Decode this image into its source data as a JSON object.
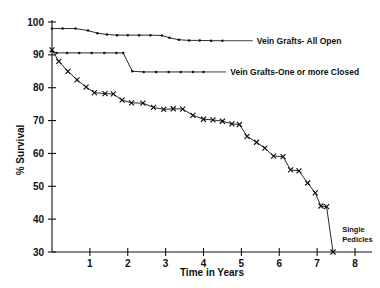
{
  "chart_data": {
    "type": "line",
    "title": "",
    "xlabel": "Time in Years",
    "ylabel": "% Survival",
    "xlim": [
      0,
      8
    ],
    "ylim": [
      30,
      100
    ],
    "grid": false,
    "legend_position": "inline-right",
    "x_ticks": [
      "1",
      "2",
      "3",
      "4",
      "5",
      "6",
      "7",
      "8"
    ],
    "x_tick_values": [
      1,
      2,
      3,
      4,
      5,
      6,
      7,
      8
    ],
    "y_ticks": [
      "30",
      "40",
      "50",
      "60",
      "70",
      "80",
      "90",
      "100"
    ],
    "y_tick_values": [
      30,
      40,
      50,
      60,
      70,
      80,
      90,
      100
    ],
    "annotations": [
      {
        "text": "Single Pedicles",
        "x": 7.45,
        "y": 30
      }
    ],
    "series": [
      {
        "name": "Vein Grafts - All Open",
        "label": "Vein Grafts- All Open",
        "marker": "dot",
        "points": [
          {
            "x": 0.0,
            "y": 98.0
          },
          {
            "x": 0.28,
            "y": 98.0
          },
          {
            "x": 0.62,
            "y": 98.0
          },
          {
            "x": 0.95,
            "y": 97.4
          },
          {
            "x": 1.2,
            "y": 96.6
          },
          {
            "x": 1.45,
            "y": 96.2
          },
          {
            "x": 1.72,
            "y": 96.0
          },
          {
            "x": 2.0,
            "y": 96.0
          },
          {
            "x": 2.3,
            "y": 96.0
          },
          {
            "x": 2.6,
            "y": 96.0
          },
          {
            "x": 2.9,
            "y": 95.9
          },
          {
            "x": 3.1,
            "y": 95.2
          },
          {
            "x": 3.35,
            "y": 94.6
          },
          {
            "x": 3.62,
            "y": 94.4
          },
          {
            "x": 3.9,
            "y": 94.4
          },
          {
            "x": 4.2,
            "y": 94.3
          },
          {
            "x": 4.5,
            "y": 94.3
          }
        ]
      },
      {
        "name": "Vein Grafts - One or more Closed",
        "label": "Vein Grafts-One or more Closed",
        "marker": "dot",
        "points": [
          {
            "x": 0.0,
            "y": 91.2
          },
          {
            "x": 0.12,
            "y": 90.6
          },
          {
            "x": 0.4,
            "y": 90.6
          },
          {
            "x": 0.72,
            "y": 90.6
          },
          {
            "x": 1.05,
            "y": 90.6
          },
          {
            "x": 1.38,
            "y": 90.6
          },
          {
            "x": 1.7,
            "y": 90.6
          },
          {
            "x": 1.88,
            "y": 90.6
          },
          {
            "x": 2.12,
            "y": 85.0
          },
          {
            "x": 2.42,
            "y": 84.8
          },
          {
            "x": 2.75,
            "y": 84.8
          },
          {
            "x": 3.08,
            "y": 84.8
          },
          {
            "x": 3.4,
            "y": 84.8
          },
          {
            "x": 3.72,
            "y": 84.8
          },
          {
            "x": 4.0,
            "y": 84.8
          }
        ]
      },
      {
        "name": "Single Pedicles",
        "label": "Single Pedicles",
        "marker": "x",
        "points": [
          {
            "x": 0.0,
            "y": 91.5
          },
          {
            "x": 0.18,
            "y": 88.0
          },
          {
            "x": 0.42,
            "y": 85.0
          },
          {
            "x": 0.66,
            "y": 82.4
          },
          {
            "x": 0.9,
            "y": 80.2
          },
          {
            "x": 1.12,
            "y": 78.5
          },
          {
            "x": 1.4,
            "y": 78.2
          },
          {
            "x": 1.62,
            "y": 78.1
          },
          {
            "x": 1.85,
            "y": 76.2
          },
          {
            "x": 2.1,
            "y": 75.4
          },
          {
            "x": 2.4,
            "y": 75.3
          },
          {
            "x": 2.68,
            "y": 74.0
          },
          {
            "x": 2.95,
            "y": 73.4
          },
          {
            "x": 3.2,
            "y": 73.6
          },
          {
            "x": 3.45,
            "y": 73.5
          },
          {
            "x": 3.72,
            "y": 71.6
          },
          {
            "x": 4.0,
            "y": 70.4
          },
          {
            "x": 4.25,
            "y": 70.2
          },
          {
            "x": 4.5,
            "y": 69.8
          },
          {
            "x": 4.75,
            "y": 69.0
          },
          {
            "x": 4.95,
            "y": 68.8
          },
          {
            "x": 5.15,
            "y": 65.2
          },
          {
            "x": 5.4,
            "y": 63.4
          },
          {
            "x": 5.62,
            "y": 61.6
          },
          {
            "x": 5.85,
            "y": 59.2
          },
          {
            "x": 6.1,
            "y": 59.0
          },
          {
            "x": 6.3,
            "y": 55.0
          },
          {
            "x": 6.52,
            "y": 54.7
          },
          {
            "x": 6.75,
            "y": 51.0
          },
          {
            "x": 6.95,
            "y": 48.0
          },
          {
            "x": 7.1,
            "y": 44.0
          },
          {
            "x": 7.25,
            "y": 43.8
          },
          {
            "x": 7.42,
            "y": 30.0
          }
        ]
      }
    ],
    "series_label_leaders": [
      {
        "series": "Vein Grafts - All Open",
        "from_x": 4.5,
        "to_x": 5.3,
        "y": 94.3
      },
      {
        "series": "Vein Grafts - One or more Closed",
        "from_x": 4.0,
        "to_x": 4.6,
        "y": 84.8
      }
    ]
  }
}
